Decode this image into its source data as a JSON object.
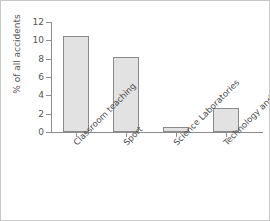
{
  "chart_data": {
    "type": "bar",
    "title": "",
    "xlabel": "",
    "ylabel": "% of all accidents",
    "categories": [
      "Classroom teaching",
      "Sport",
      "Science Laboratories",
      "Technology and art"
    ],
    "values": [
      10.5,
      8.2,
      0.6,
      2.6
    ],
    "ylim": [
      0,
      12
    ],
    "yticks": [
      0,
      2,
      4,
      6,
      8,
      10,
      12
    ],
    "ytick_labels": [
      "0",
      "2",
      "4",
      "6",
      "8",
      "10",
      "12"
    ],
    "grid": false,
    "legend": null,
    "bar_fill_color": "#e2e2e2",
    "bar_border_color": "#8a8a8a",
    "axis_color": "#8d8d8d",
    "text_color": "#555555"
  }
}
